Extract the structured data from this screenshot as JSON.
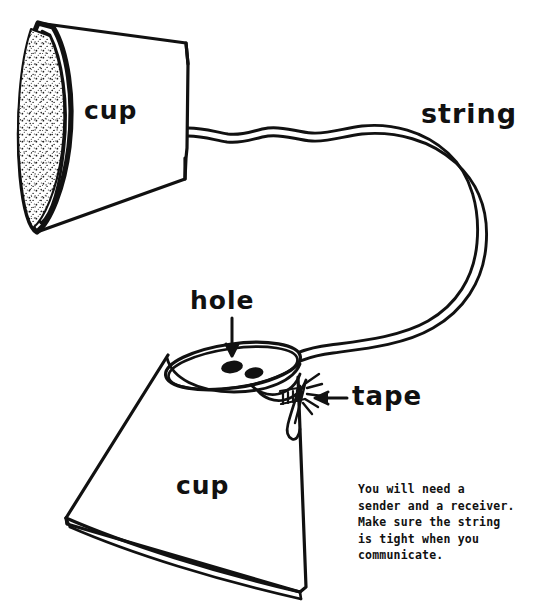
{
  "figure": {
    "ink_color": "#111111",
    "paper_color": "#ffffff"
  },
  "labels": {
    "cup_top": "cup",
    "cup_bottom": "cup",
    "string": "string",
    "hole": "hole",
    "tape": "tape"
  },
  "instructions": {
    "line1": "You will need a",
    "line2": "sender and a receiver.",
    "line3": "Make sure the string",
    "line4": "is tight when you",
    "line5": "communicate."
  },
  "parts": {
    "upper_cup": {
      "name": "cup",
      "mouth": "stippled elliptical opening facing left",
      "orientation": "lying on its side, mouth to the left, base to the right"
    },
    "lower_cup": {
      "name": "cup",
      "mouth": "elliptical rim facing up, tilted",
      "orientation": "upright and tilted, rim at top, base at bottom"
    },
    "string_part": {
      "name": "string",
      "path": "exits the base of the upper cup, wiggles right, loops in a wide arc to the right, returns left and down into the hole of the lower cup"
    },
    "hole_part": {
      "name": "hole",
      "count": 2,
      "location": "in the rim area of the lower cup"
    },
    "tape_part": {
      "name": "tape",
      "location": "on the right edge of the lower cup rim where the string is knotted"
    }
  },
  "annotations": {
    "hole_arrow": "arrow pointing down to the hole",
    "tape_arrow": "arrow pointing left to the tape"
  }
}
